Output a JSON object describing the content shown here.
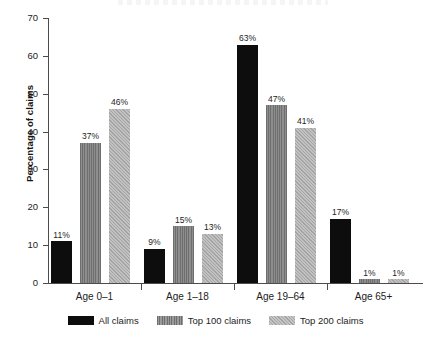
{
  "chart_data": {
    "type": "bar",
    "title": "",
    "xlabel": "",
    "ylabel": "Percentage of claims",
    "ylim": [
      0,
      70
    ],
    "yticks": [
      0,
      10,
      20,
      30,
      40,
      50,
      60,
      70
    ],
    "ytick_labels": [
      "0",
      "10",
      "20",
      "30",
      "40",
      "50",
      "60",
      "70"
    ],
    "grid": false,
    "legend_position": "bottom",
    "value_suffix": "%",
    "categories": [
      "Age 0–1",
      "Age 1–18",
      "Age 19–64",
      "Age 65+"
    ],
    "series": [
      {
        "name": "All claims",
        "color": "#0d0d0d",
        "pattern": "solid",
        "values": [
          11,
          9,
          63,
          17
        ],
        "labels": [
          "11%",
          "9%",
          "63%",
          "17%"
        ]
      },
      {
        "name": "Top 100 claims",
        "color": "#7b7b7b",
        "pattern": "vertical-stripes",
        "values": [
          37,
          15,
          47,
          1
        ],
        "labels": [
          "37%",
          "15%",
          "47%",
          "1%"
        ]
      },
      {
        "name": "Top 200 claims",
        "color": "#b2b2b2",
        "pattern": "diagonal-hatch",
        "values": [
          46,
          13,
          41,
          1
        ],
        "labels": [
          "46%",
          "13%",
          "41%",
          "1%"
        ]
      }
    ]
  },
  "legend": {
    "items": [
      {
        "label": "All claims"
      },
      {
        "label": "Top 100 claims"
      },
      {
        "label": "Top 200 claims"
      }
    ]
  }
}
